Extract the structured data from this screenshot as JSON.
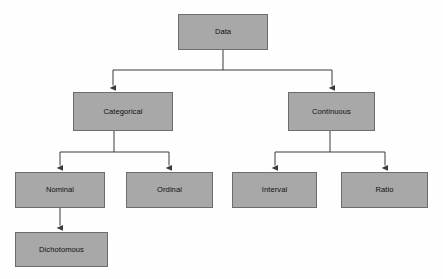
{
  "diagram": {
    "background_color": "#fefefe",
    "node_fill_color": "#a8a8a8",
    "node_border_color": "#6d6d6d",
    "edge_color": "#3a3a3a",
    "text_color": "#101010",
    "nodes": [
      {
        "id": "data",
        "label": "Data",
        "x": 178,
        "y": 14,
        "w": 90,
        "h": 36,
        "level": 0
      },
      {
        "id": "categorical",
        "label": "Categorical",
        "x": 73,
        "y": 92,
        "w": 100,
        "h": 39,
        "level": 1
      },
      {
        "id": "continuous",
        "label": "Continuous",
        "x": 288,
        "y": 92,
        "w": 87,
        "h": 39,
        "level": 1
      },
      {
        "id": "nominal",
        "label": "Nominal",
        "x": 15,
        "y": 172,
        "w": 90,
        "h": 36,
        "level": 2
      },
      {
        "id": "ordinal",
        "label": "Ordinal",
        "x": 126,
        "y": 172,
        "w": 87,
        "h": 36,
        "level": 2
      },
      {
        "id": "interval",
        "label": "Interval",
        "x": 232,
        "y": 172,
        "w": 85,
        "h": 36,
        "level": 2
      },
      {
        "id": "ratio",
        "label": "Ratio",
        "x": 341,
        "y": 172,
        "w": 87,
        "h": 36,
        "level": 2
      },
      {
        "id": "dichotomous",
        "label": "Dichotomous",
        "x": 15,
        "y": 232,
        "w": 93,
        "h": 35,
        "level": 3
      }
    ],
    "edges": [
      {
        "from": "data",
        "to": "categorical"
      },
      {
        "from": "data",
        "to": "continuous"
      },
      {
        "from": "categorical",
        "to": "nominal"
      },
      {
        "from": "categorical",
        "to": "ordinal"
      },
      {
        "from": "continuous",
        "to": "interval"
      },
      {
        "from": "continuous",
        "to": "ratio"
      },
      {
        "from": "nominal",
        "to": "dichotomous"
      }
    ]
  }
}
